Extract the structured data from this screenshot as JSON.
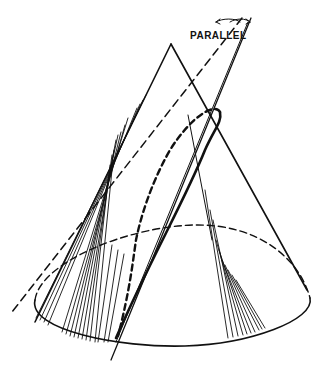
{
  "figure": {
    "label": "PARALLEL",
    "ink_color": "#111111",
    "background": "#ffffff"
  }
}
